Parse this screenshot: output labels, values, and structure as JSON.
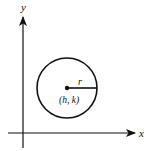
{
  "diagram": {
    "axes": {
      "x_label": "x",
      "y_label": "y"
    },
    "circle": {
      "center_label": "(h, k)",
      "radius_label": "r"
    },
    "colors": {
      "stroke": "#111111",
      "background": "#ffffff"
    }
  }
}
